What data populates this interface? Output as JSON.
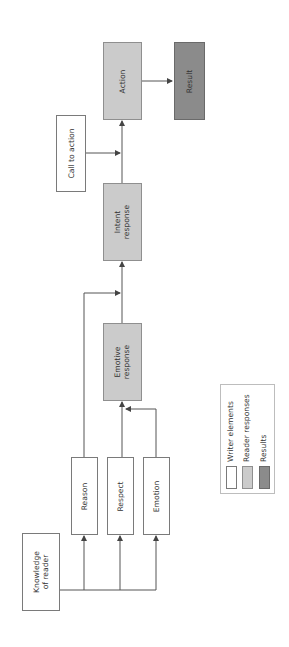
{
  "diagram": {
    "orientation": "rotated-90-ccw",
    "nodes": {
      "knowledge": {
        "line1": "Knowledge",
        "line2": "of reader",
        "category": "writer"
      },
      "reason": {
        "label": "Reason",
        "category": "writer"
      },
      "respect": {
        "label": "Respect",
        "category": "writer"
      },
      "emotion": {
        "label": "Emotion",
        "category": "writer"
      },
      "emotive": {
        "line1": "Emotive",
        "line2": "response",
        "category": "reader"
      },
      "intent": {
        "line1": "Intent",
        "line2": "response",
        "category": "reader"
      },
      "call_to_action": {
        "label": "Call to action",
        "category": "writer"
      },
      "action": {
        "label": "Action",
        "category": "reader"
      },
      "result": {
        "label": "Result",
        "category": "result"
      }
    },
    "edges": [
      {
        "from": "knowledge",
        "to": "reason"
      },
      {
        "from": "knowledge",
        "to": "respect"
      },
      {
        "from": "knowledge",
        "to": "emotion"
      },
      {
        "from": "reason",
        "to": "intent"
      },
      {
        "from": "respect",
        "to": "emotive"
      },
      {
        "from": "emotion",
        "to": "emotive"
      },
      {
        "from": "emotive",
        "to": "intent"
      },
      {
        "from": "intent",
        "to": "action"
      },
      {
        "from": "call_to_action",
        "to": "action"
      },
      {
        "from": "action",
        "to": "result"
      }
    ]
  },
  "legend": {
    "items": [
      {
        "label": "Writer elements",
        "color": "#ffffff"
      },
      {
        "label": "Reader responses",
        "color": "#cbcbcb"
      },
      {
        "label": "Results",
        "color": "#8b8b8b"
      }
    ]
  },
  "colors": {
    "writer_fill": "#ffffff",
    "reader_fill": "#cbcbcb",
    "result_fill": "#8b8b8b",
    "line": "#555555"
  }
}
